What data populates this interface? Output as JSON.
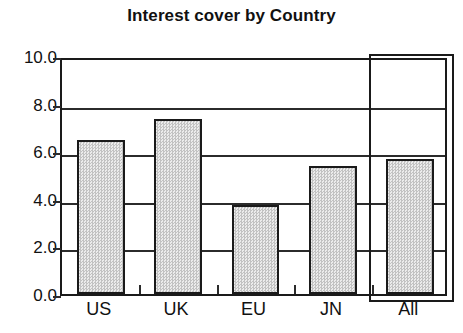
{
  "chart_data": {
    "type": "bar",
    "title": "Interest cover by Country",
    "xlabel": "",
    "ylabel": "",
    "categories": [
      "US",
      "UK",
      "EU",
      "JN",
      "All"
    ],
    "values": [
      6.4,
      7.25,
      3.65,
      5.3,
      5.6
    ],
    "series": [
      {
        "name": "Interest cover",
        "values": [
          6.4,
          7.25,
          3.65,
          5.3,
          5.6
        ]
      }
    ],
    "ylim": [
      0.0,
      10.0
    ],
    "ytick_labels": [
      "10.0",
      "8.0",
      "6.0",
      "4.0",
      "2.0",
      "0.0"
    ],
    "ytick_values": [
      10.0,
      8.0,
      6.0,
      4.0,
      2.0,
      0.0
    ],
    "grid": true,
    "grid_axis": "y",
    "legend": false,
    "legend_position": "none",
    "annotations": [
      {
        "name": "all-highlight-box",
        "category": "All",
        "description": "rectangle outline drawn around the All column"
      }
    ],
    "bar_fill_color": "#d4d4d4",
    "bar_edge_color": "#1a1a1a",
    "axis_color": "#2b2b2b",
    "background_color": "#ffffff"
  }
}
